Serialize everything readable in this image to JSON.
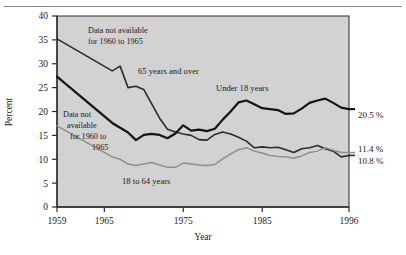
{
  "figure": {
    "plot_bg": "#d2d2d2",
    "frame_color": "#2b2b2b"
  },
  "axes": {
    "y_title": "Percent",
    "x_title": "Year",
    "y_ticks": [
      "0",
      "5",
      "10",
      "15",
      "20",
      "25",
      "30",
      "35",
      "40"
    ],
    "x_ticks": [
      "1959",
      "1965",
      "1975",
      "1985",
      "1996"
    ]
  },
  "annotations": {
    "top_note_line1": "Data not available",
    "top_note_line2": "for 1960 to 1965",
    "mid_note_line1": "Data not",
    "mid_note_line2": "available",
    "mid_note_line3": "for 1960 to",
    "mid_note_line4": "1965"
  },
  "series_labels": {
    "elderly": "65 years and over",
    "children": "Under 18 years",
    "adults": "18 to 64 years"
  },
  "end_labels": {
    "children": "20.5 %",
    "adults": "11.4 %",
    "elderly": "10.8 %"
  },
  "chart_data": {
    "type": "line",
    "title": "",
    "xlabel": "Year",
    "ylabel": "Percent",
    "xlim": [
      1959,
      1996
    ],
    "ylim": [
      0,
      40
    ],
    "yticks": [
      0,
      5,
      10,
      15,
      20,
      25,
      30,
      35,
      40
    ],
    "xticks": [
      1959,
      1965,
      1975,
      1985,
      1996
    ],
    "grid": false,
    "legend": "inline-labels",
    "notes": [
      "Data not available for 1960 to 1965",
      "Data not available for 1960 to 1965"
    ],
    "series": [
      {
        "name": "65 years and over",
        "color": "#2b2b2b",
        "width": 1.6,
        "end_label": "10.8 %",
        "x": [
          1959,
          1966,
          1967,
          1968,
          1969,
          1970,
          1971,
          1972,
          1973,
          1974,
          1975,
          1976,
          1977,
          1978,
          1979,
          1980,
          1981,
          1982,
          1983,
          1984,
          1985,
          1986,
          1987,
          1988,
          1989,
          1990,
          1991,
          1992,
          1993,
          1994,
          1995,
          1996
        ],
        "y": [
          35.2,
          28.5,
          29.5,
          25.0,
          25.3,
          24.6,
          21.6,
          18.6,
          16.3,
          15.7,
          15.3,
          15.0,
          14.1,
          14.0,
          15.2,
          15.7,
          15.3,
          14.6,
          13.8,
          12.4,
          12.6,
          12.4,
          12.5,
          12.0,
          11.4,
          12.2,
          12.4,
          12.9,
          12.2,
          11.7,
          10.5,
          10.8
        ]
      },
      {
        "name": "Under 18 years",
        "color": "#141414",
        "width": 2.2,
        "end_label": "20.5 %",
        "x": [
          1959,
          1966,
          1967,
          1968,
          1969,
          1970,
          1971,
          1972,
          1973,
          1974,
          1975,
          1976,
          1977,
          1978,
          1979,
          1980,
          1981,
          1982,
          1983,
          1984,
          1985,
          1986,
          1987,
          1988,
          1989,
          1990,
          1991,
          1992,
          1993,
          1994,
          1995,
          1996
        ],
        "y": [
          27.3,
          17.6,
          16.6,
          15.6,
          14.0,
          15.1,
          15.3,
          15.1,
          14.4,
          15.4,
          17.1,
          16.0,
          16.2,
          15.9,
          16.4,
          18.3,
          20.0,
          21.9,
          22.3,
          21.5,
          20.7,
          20.5,
          20.3,
          19.5,
          19.6,
          20.6,
          21.8,
          22.3,
          22.7,
          21.8,
          20.8,
          20.5
        ]
      },
      {
        "name": "18 to 64 years",
        "color": "#8e8e8e",
        "width": 1.5,
        "end_label": "11.4 %",
        "x": [
          1959,
          1966,
          1967,
          1968,
          1969,
          1970,
          1971,
          1972,
          1973,
          1974,
          1975,
          1976,
          1977,
          1978,
          1979,
          1980,
          1981,
          1982,
          1983,
          1984,
          1985,
          1986,
          1987,
          1988,
          1989,
          1990,
          1991,
          1992,
          1993,
          1994,
          1995,
          1996
        ],
        "y": [
          17.0,
          10.5,
          10.0,
          9.0,
          8.7,
          9.0,
          9.3,
          8.8,
          8.3,
          8.3,
          9.2,
          9.0,
          8.8,
          8.7,
          8.9,
          10.1,
          11.1,
          12.0,
          12.4,
          11.7,
          11.3,
          10.8,
          10.6,
          10.5,
          10.2,
          10.7,
          11.4,
          11.7,
          12.4,
          11.9,
          11.4,
          11.4
        ]
      }
    ]
  }
}
